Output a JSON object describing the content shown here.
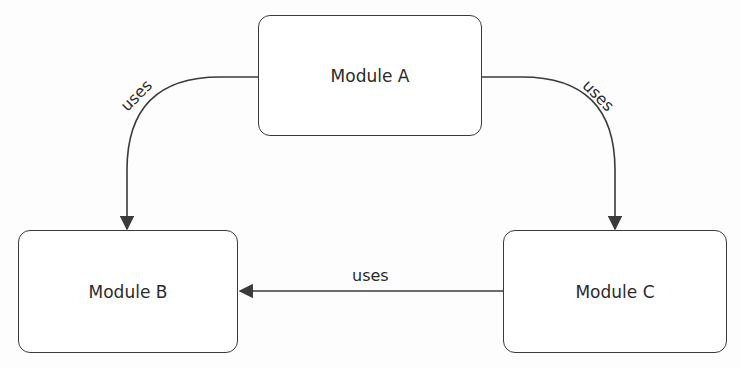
{
  "diagram": {
    "type": "dependency-graph",
    "colors": {
      "background": "#fdfdfd",
      "stroke": "#3a3a3a",
      "text": "#2b2b2b",
      "node_fill": "#ffffff"
    },
    "nodes": [
      {
        "id": "A",
        "label": "Module A"
      },
      {
        "id": "B",
        "label": "Module B"
      },
      {
        "id": "C",
        "label": "Module C"
      }
    ],
    "edges": [
      {
        "from": "A",
        "to": "B",
        "label": "uses"
      },
      {
        "from": "A",
        "to": "C",
        "label": "uses"
      },
      {
        "from": "C",
        "to": "B",
        "label": "uses"
      }
    ]
  }
}
